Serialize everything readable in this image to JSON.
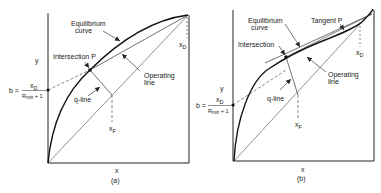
{
  "figure": {
    "panels": [
      {
        "id": "a",
        "caption": "(a)",
        "x_axis_label": "x",
        "y_axis_label": "y",
        "labels": {
          "equilibrium_1": "Equilibrium",
          "equilibrium_2": "curve",
          "intersection": "Intersection P",
          "operating_1": "Operating",
          "operating_2": "line",
          "q_line": "q-line",
          "x_d": "x",
          "x_d_sub": "D",
          "x_f": "x",
          "x_f_sub": "F",
          "b_prefix": "b =",
          "b_num": "x",
          "b_num_sub": "D",
          "b_den": "R",
          "b_den_sub": "min",
          "b_den_tail": " + 1"
        }
      },
      {
        "id": "b",
        "caption": "(b)",
        "x_axis_label": "x",
        "y_axis_label": "y",
        "labels": {
          "equilibrium_1": "Equilibrium",
          "equilibrium_2": "curve",
          "tangent": "Tangent P",
          "intersection": "Intersection",
          "operating_1": "Operating",
          "operating_2": "line",
          "q_line": "q-line",
          "x_d": "x",
          "x_d_sub": "D",
          "x_f": "x",
          "x_f_sub": "F",
          "b_prefix": "b =",
          "b_num": "x",
          "b_num_sub": "D",
          "b_den": "R",
          "b_den_sub": "min",
          "b_den_tail": " + 1"
        }
      }
    ],
    "colors": {
      "line": "#222222",
      "background": "#ffffff"
    }
  }
}
